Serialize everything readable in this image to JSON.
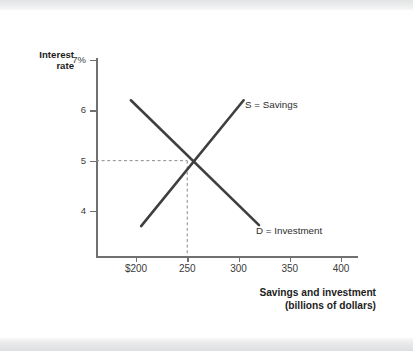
{
  "chart_data": {
    "type": "line",
    "title": "",
    "xlabel": "Savings and investment (billions of dollars)",
    "ylabel": "Interest rate",
    "xlim": [
      175,
      415
    ],
    "ylim": [
      3.2,
      7.2
    ],
    "grid": false,
    "legend_position": "inline-curve-end",
    "x_ticks": [
      {
        "label": "$200",
        "value": 200
      },
      {
        "label": "250",
        "value": 250
      },
      {
        "label": "300",
        "value": 300
      },
      {
        "label": "350",
        "value": 350
      },
      {
        "label": "400",
        "value": 400
      }
    ],
    "y_ticks": [
      {
        "label": "7%",
        "value": 7
      },
      {
        "label": "6",
        "value": 6
      },
      {
        "label": "5",
        "value": 5
      },
      {
        "label": "4",
        "value": 4
      }
    ],
    "series": [
      {
        "name": "S = Savings",
        "label": "S = Savings",
        "role": "supply",
        "points": [
          {
            "x": 205,
            "y": 3.7
          },
          {
            "x": 305,
            "y": 6.2
          }
        ]
      },
      {
        "name": "D = Investment",
        "label": "D = Investment",
        "role": "demand",
        "points": [
          {
            "x": 195,
            "y": 6.2
          },
          {
            "x": 320,
            "y": 3.72
          }
        ]
      }
    ],
    "equilibrium": {
      "x": 250,
      "y": 5,
      "guides": "dashed"
    },
    "annotations": [
      {
        "text": "S = Savings",
        "x": 305,
        "y": 6.2
      },
      {
        "text": "D = Investment",
        "x": 320,
        "y": 3.72
      }
    ],
    "colors": {
      "curve": "#3f3f3f",
      "axis": "#6f7072",
      "guide": "#8a8a8a",
      "text": "#2e2e2e",
      "background": "#ffffff",
      "band": "#e5e6e8"
    }
  },
  "axis": {
    "y_title_line1": "Interest",
    "y_title_line2": "rate",
    "x_title_line1": "Savings and investment",
    "x_title_line2": "(billions of dollars)"
  }
}
